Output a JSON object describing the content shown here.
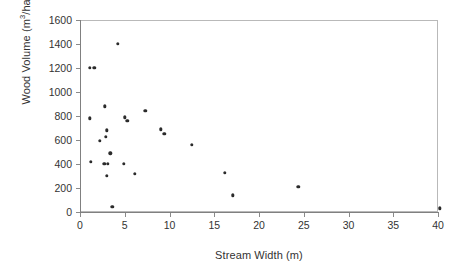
{
  "chart_data": {
    "type": "scatter",
    "title": "",
    "xlabel": "Stream Width (m)",
    "ylabel_text": "Wood Volume (m",
    "ylabel_sup": "3",
    "ylabel_tail": "/ha)",
    "ylabel_full": "Wood Volume (m3/ha)",
    "xlim": [
      0,
      40
    ],
    "ylim": [
      0,
      1600
    ],
    "xticks": [
      0,
      5,
      10,
      15,
      20,
      25,
      30,
      35,
      40
    ],
    "yticks": [
      0,
      200,
      400,
      600,
      800,
      1000,
      1200,
      1400,
      1600
    ],
    "grid": false,
    "legend": null,
    "marker_color": "#2b2b2b",
    "axis_color": "#808080",
    "points": [
      {
        "x": 1.1,
        "y": 1200
      },
      {
        "x": 1.6,
        "y": 1200
      },
      {
        "x": 4.2,
        "y": 1400
      },
      {
        "x": 1.1,
        "y": 780
      },
      {
        "x": 2.8,
        "y": 880
      },
      {
        "x": 2.2,
        "y": 595
      },
      {
        "x": 2.9,
        "y": 625
      },
      {
        "x": 3.0,
        "y": 680
      },
      {
        "x": 3.4,
        "y": 490
      },
      {
        "x": 1.2,
        "y": 420
      },
      {
        "x": 2.7,
        "y": 400
      },
      {
        "x": 3.1,
        "y": 400
      },
      {
        "x": 3.0,
        "y": 300
      },
      {
        "x": 3.6,
        "y": 45
      },
      {
        "x": 4.9,
        "y": 400
      },
      {
        "x": 6.1,
        "y": 320
      },
      {
        "x": 5.3,
        "y": 760
      },
      {
        "x": 5.0,
        "y": 790
      },
      {
        "x": 7.3,
        "y": 845
      },
      {
        "x": 9.0,
        "y": 690
      },
      {
        "x": 9.4,
        "y": 650
      },
      {
        "x": 12.5,
        "y": 560
      },
      {
        "x": 16.2,
        "y": 325
      },
      {
        "x": 17.1,
        "y": 140
      },
      {
        "x": 24.4,
        "y": 210
      },
      {
        "x": 40.2,
        "y": 30
      }
    ]
  }
}
